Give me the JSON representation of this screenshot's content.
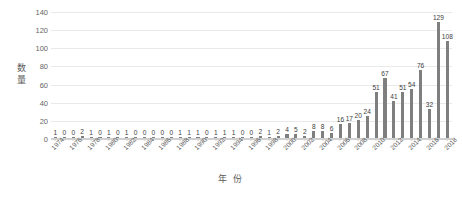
{
  "chart_data": {
    "type": "bar",
    "title": "",
    "xlabel": "年 份",
    "ylabel": "数量",
    "ylim": [
      0,
      140
    ],
    "yticks": [
      0,
      20,
      40,
      60,
      80,
      100,
      120,
      140
    ],
    "grid": true,
    "legend": "none",
    "bar_color": "#7f7f7f",
    "gridline_color": "#e9e9e9",
    "label_color": "#3d3d3d",
    "categories": [
      "1974",
      "1975",
      "1976",
      "1977",
      "1978",
      "1979",
      "1980",
      "1981",
      "1982",
      "1983",
      "1984",
      "1985",
      "1986",
      "1987",
      "1988",
      "1989",
      "1990",
      "1991",
      "1992",
      "1993",
      "1994",
      "1995",
      "1996",
      "1997",
      "1998",
      "1999",
      "2000",
      "2001",
      "2002",
      "2003",
      "2004",
      "2005",
      "2006",
      "2007",
      "2008",
      "2009",
      "2010",
      "2011",
      "2012",
      "2013",
      "2014",
      "2015",
      "2016",
      "2017",
      "2018"
    ],
    "xtick_labels": [
      "1974",
      "1976",
      "1978",
      "1980",
      "1982",
      "1984",
      "1986",
      "1988",
      "1990",
      "1992",
      "1994",
      "1996",
      "1998",
      "2000",
      "2002",
      "2004",
      "2006",
      "2008",
      "2010",
      "2012",
      "2014",
      "2016",
      "2018"
    ],
    "values": [
      1,
      0,
      0,
      2,
      1,
      0,
      1,
      0,
      1,
      0,
      0,
      0,
      0,
      0,
      1,
      1,
      1,
      0,
      1,
      1,
      1,
      0,
      0,
      2,
      1,
      2,
      4,
      5,
      2,
      8,
      8,
      6,
      16,
      17,
      20,
      24,
      51,
      67,
      41,
      51,
      54,
      76,
      32,
      129,
      108
    ],
    "data_labels": [
      "1",
      "0",
      "0",
      "2",
      "1",
      "0",
      "1",
      "0",
      "1",
      "0",
      "0",
      "0",
      "0",
      "0",
      "1",
      "1",
      "1",
      "0",
      "1",
      "1",
      "1",
      "0",
      "0",
      "2",
      "1",
      "2",
      "4",
      "5",
      "2",
      "8",
      "8",
      "6",
      "16",
      "17",
      "20",
      "24",
      "51",
      "67",
      "41",
      "51",
      "54",
      "76",
      "32",
      "129",
      "108"
    ]
  }
}
